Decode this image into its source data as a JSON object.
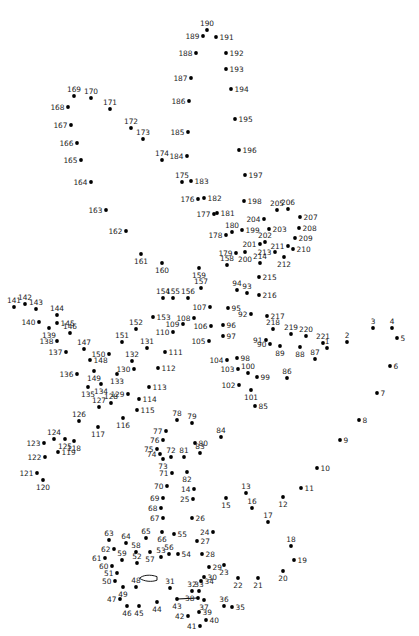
{
  "puzzle": {
    "kind": "connect-the-dots",
    "width": 419,
    "height": 636,
    "dot_radius": 1.9,
    "dot_color": "#000000",
    "label_color": "#1c1c1c",
    "label_font_size": 7.4,
    "point_fields": [
      "number",
      "x",
      "y",
      "label_side"
    ],
    "label_sides": {
      "a": "above",
      "b": "below",
      "l": "left",
      "r": "right"
    },
    "points": [
      [
        1,
        327,
        348,
        "a"
      ],
      [
        2,
        347,
        342,
        "a"
      ],
      [
        3,
        373,
        328,
        "a"
      ],
      [
        4,
        392,
        328,
        "a"
      ],
      [
        5,
        397,
        338,
        "r"
      ],
      [
        6,
        390,
        366,
        "r"
      ],
      [
        7,
        377,
        393,
        "r"
      ],
      [
        8,
        359,
        420,
        "r"
      ],
      [
        9,
        340,
        440,
        "r"
      ],
      [
        10,
        317,
        468,
        "r"
      ],
      [
        11,
        301,
        488,
        "r"
      ],
      [
        12,
        283,
        497,
        "b"
      ],
      [
        13,
        246,
        493,
        "a"
      ],
      [
        14,
        194,
        489,
        "l"
      ],
      [
        15,
        226,
        498,
        "b"
      ],
      [
        16,
        252,
        508,
        "a"
      ],
      [
        17,
        268,
        522,
        "a"
      ],
      [
        18,
        291,
        546,
        "a"
      ],
      [
        19,
        294,
        560,
        "r"
      ],
      [
        20,
        283,
        571,
        "b"
      ],
      [
        21,
        258,
        578,
        "b"
      ],
      [
        22,
        238,
        578,
        "b"
      ],
      [
        23,
        224,
        565,
        "b"
      ],
      [
        24,
        213,
        532,
        "l"
      ],
      [
        25,
        193,
        499,
        "l"
      ],
      [
        26,
        192,
        518,
        "r"
      ],
      [
        27,
        197,
        541,
        "r"
      ],
      [
        28,
        202,
        554,
        "r"
      ],
      [
        29,
        209,
        567,
        "r"
      ],
      [
        30,
        204,
        577,
        "r"
      ],
      [
        31,
        170,
        588,
        "a"
      ],
      [
        32,
        192,
        591,
        "a"
      ],
      [
        33,
        199,
        591,
        "a"
      ],
      [
        34,
        201,
        581,
        "r"
      ],
      [
        35,
        232,
        607,
        "r"
      ],
      [
        36,
        224,
        606,
        "a"
      ],
      [
        37,
        204,
        600,
        "b"
      ],
      [
        38,
        198,
        598,
        "l"
      ],
      [
        39,
        199,
        612,
        "r"
      ],
      [
        40,
        206,
        620,
        "r"
      ],
      [
        41,
        200,
        626,
        "l"
      ],
      [
        42,
        188,
        616,
        "l"
      ],
      [
        43,
        177,
        599,
        "b"
      ],
      [
        44,
        157,
        602,
        "b"
      ],
      [
        45,
        139,
        606,
        "b"
      ],
      [
        46,
        127,
        606,
        "b"
      ],
      [
        47,
        120,
        599,
        "l"
      ],
      [
        48,
        136,
        587,
        "a"
      ],
      [
        49,
        123,
        587,
        "b"
      ],
      [
        50,
        115,
        581,
        "l"
      ],
      [
        51,
        117,
        573,
        "l"
      ],
      [
        52,
        137,
        563,
        "a"
      ],
      [
        53,
        161,
        557,
        "a"
      ],
      [
        54,
        178,
        554,
        "r"
      ],
      [
        55,
        174,
        534,
        "r"
      ],
      [
        56,
        169,
        554,
        "a"
      ],
      [
        57,
        150,
        552,
        "b"
      ],
      [
        58,
        136,
        552,
        "a"
      ],
      [
        59,
        122,
        560,
        "a"
      ],
      [
        60,
        112,
        566,
        "l"
      ],
      [
        61,
        105,
        558,
        "l"
      ],
      [
        62,
        114,
        549,
        "l"
      ],
      [
        63,
        109,
        540,
        "a"
      ],
      [
        64,
        126,
        543,
        "a"
      ],
      [
        65,
        146,
        538,
        "a"
      ],
      [
        66,
        162,
        532,
        "b"
      ],
      [
        67,
        163,
        518,
        "l"
      ],
      [
        68,
        161,
        508,
        "l"
      ],
      [
        69,
        163,
        498,
        "l"
      ],
      [
        70,
        167,
        486,
        "l"
      ],
      [
        71,
        172,
        473,
        "l"
      ],
      [
        72,
        171,
        457,
        "a"
      ],
      [
        73,
        163,
        459,
        "b"
      ],
      [
        74,
        160,
        454,
        "l"
      ],
      [
        75,
        157,
        449,
        "l"
      ],
      [
        76,
        163,
        440,
        "l"
      ],
      [
        77,
        166,
        431,
        "l"
      ],
      [
        78,
        177,
        420,
        "a"
      ],
      [
        79,
        192,
        423,
        "a"
      ],
      [
        80,
        195,
        443,
        "r"
      ],
      [
        81,
        184,
        457,
        "a"
      ],
      [
        82,
        187,
        472,
        "b"
      ],
      [
        83,
        200,
        453,
        "a"
      ],
      [
        84,
        221,
        437,
        "a"
      ],
      [
        85,
        255,
        406,
        "r"
      ],
      [
        86,
        287,
        378,
        "a"
      ],
      [
        87,
        315,
        359,
        "a"
      ],
      [
        88,
        300,
        347,
        "b"
      ],
      [
        89,
        280,
        346,
        "b"
      ],
      [
        90,
        270,
        344,
        "l"
      ],
      [
        91,
        266,
        340,
        "l"
      ],
      [
        92,
        251,
        314,
        "l"
      ],
      [
        93,
        247,
        293,
        "a"
      ],
      [
        94,
        237,
        290,
        "a"
      ],
      [
        95,
        228,
        308,
        "r"
      ],
      [
        96,
        223,
        325,
        "r"
      ],
      [
        97,
        223,
        336,
        "r"
      ],
      [
        98,
        237,
        358,
        "r"
      ],
      [
        99,
        257,
        377,
        "r"
      ],
      [
        100,
        248,
        373,
        "a"
      ],
      [
        101,
        251,
        390,
        "b"
      ],
      [
        102,
        239,
        385,
        "l"
      ],
      [
        103,
        238,
        369,
        "l"
      ],
      [
        104,
        227,
        360,
        "l"
      ],
      [
        105,
        209,
        341,
        "l"
      ],
      [
        106,
        211,
        326,
        "l"
      ],
      [
        107,
        210,
        307,
        "l"
      ],
      [
        108,
        194,
        318,
        "l"
      ],
      [
        109,
        183,
        324,
        "l"
      ],
      [
        110,
        173,
        332,
        "l"
      ],
      [
        111,
        165,
        352,
        "r"
      ],
      [
        112,
        158,
        368,
        "r"
      ],
      [
        113,
        149,
        387,
        "r"
      ],
      [
        114,
        139,
        399,
        "r"
      ],
      [
        115,
        137,
        410,
        "r"
      ],
      [
        116,
        123,
        418,
        "b"
      ],
      [
        117,
        98,
        427,
        "b"
      ],
      [
        118,
        74,
        441,
        "b"
      ],
      [
        119,
        58,
        452,
        "r"
      ],
      [
        120,
        43,
        480,
        "b"
      ],
      [
        121,
        37,
        473,
        "l"
      ],
      [
        122,
        45,
        457,
        "l"
      ],
      [
        123,
        44,
        443,
        "l"
      ],
      [
        124,
        54,
        439,
        "a"
      ],
      [
        125,
        65,
        439,
        "b"
      ],
      [
        126,
        79,
        421,
        "a"
      ],
      [
        127,
        99,
        407,
        "a"
      ],
      [
        128,
        111,
        403,
        "a"
      ],
      [
        129,
        128,
        394,
        "l"
      ],
      [
        130,
        134,
        369,
        "l"
      ],
      [
        131,
        147,
        348,
        "a"
      ],
      [
        132,
        132,
        361,
        "a"
      ],
      [
        133,
        117,
        374,
        "b"
      ],
      [
        134,
        101,
        384,
        "b"
      ],
      [
        135,
        88,
        387,
        "b"
      ],
      [
        136,
        77,
        374,
        "l"
      ],
      [
        137,
        66,
        352,
        "l"
      ],
      [
        138,
        57,
        341,
        "l"
      ],
      [
        139,
        49,
        328,
        "b"
      ],
      [
        140,
        39,
        322,
        "l"
      ],
      [
        141,
        14,
        307,
        "a"
      ],
      [
        142,
        25,
        304,
        "a"
      ],
      [
        143,
        36,
        309,
        "a"
      ],
      [
        144,
        57,
        315,
        "a"
      ],
      [
        145,
        57,
        323,
        "r"
      ],
      [
        146,
        70,
        333,
        "a"
      ],
      [
        147,
        84,
        349,
        "a"
      ],
      [
        148,
        90,
        360,
        "r"
      ],
      [
        149,
        94,
        371,
        "b"
      ],
      [
        150,
        109,
        354,
        "l"
      ],
      [
        151,
        122,
        342,
        "a"
      ],
      [
        152,
        136,
        329,
        "a"
      ],
      [
        153,
        153,
        317,
        "r"
      ],
      [
        154,
        163,
        298,
        "a"
      ],
      [
        155,
        173,
        298,
        "a"
      ],
      [
        156,
        188,
        298,
        "a"
      ],
      [
        157,
        201,
        288,
        "a"
      ],
      [
        158,
        227,
        265,
        "a"
      ],
      [
        159,
        199,
        268,
        "b"
      ],
      [
        160,
        162,
        263,
        "b"
      ],
      [
        161,
        141,
        254,
        "b"
      ],
      [
        162,
        126,
        231,
        "l"
      ],
      [
        163,
        106,
        210,
        "l"
      ],
      [
        164,
        91,
        182,
        "l"
      ],
      [
        165,
        81,
        160,
        "l"
      ],
      [
        166,
        77,
        143,
        "l"
      ],
      [
        167,
        71,
        125,
        "l"
      ],
      [
        168,
        68,
        107,
        "l"
      ],
      [
        169,
        74,
        96,
        "a"
      ],
      [
        170,
        91,
        98,
        "a"
      ],
      [
        171,
        110,
        109,
        "a"
      ],
      [
        172,
        131,
        128,
        "a"
      ],
      [
        173,
        143,
        139,
        "a"
      ],
      [
        174,
        162,
        160,
        "a"
      ],
      [
        175,
        182,
        182,
        "a"
      ],
      [
        176,
        198,
        199,
        "l"
      ],
      [
        177,
        214,
        214,
        "l"
      ],
      [
        178,
        226,
        235,
        "l"
      ],
      [
        179,
        236,
        253,
        "l"
      ],
      [
        180,
        232,
        232,
        "a"
      ],
      [
        181,
        217,
        213,
        "r"
      ],
      [
        182,
        204,
        198,
        "r"
      ],
      [
        183,
        191,
        181,
        "r"
      ],
      [
        184,
        187,
        156,
        "l"
      ],
      [
        185,
        188,
        132,
        "l"
      ],
      [
        186,
        189,
        101,
        "l"
      ],
      [
        187,
        191,
        78,
        "l"
      ],
      [
        188,
        196,
        53,
        "l"
      ],
      [
        189,
        203,
        36,
        "l"
      ],
      [
        190,
        207,
        30,
        "a"
      ],
      [
        191,
        216,
        37,
        "r"
      ],
      [
        192,
        226,
        53,
        "r"
      ],
      [
        193,
        226,
        69,
        "r"
      ],
      [
        194,
        231,
        89,
        "r"
      ],
      [
        195,
        235,
        119,
        "r"
      ],
      [
        196,
        239,
        150,
        "r"
      ],
      [
        197,
        245,
        175,
        "r"
      ],
      [
        198,
        244,
        201,
        "r"
      ],
      [
        199,
        242,
        230,
        "r"
      ],
      [
        200,
        245,
        252,
        "b"
      ],
      [
        201,
        260,
        244,
        "l"
      ],
      [
        202,
        265,
        242,
        "a"
      ],
      [
        203,
        269,
        229,
        "r"
      ],
      [
        204,
        264,
        219,
        "l"
      ],
      [
        205,
        277,
        210,
        "a"
      ],
      [
        206,
        288,
        209,
        "a"
      ],
      [
        207,
        300,
        217,
        "r"
      ],
      [
        208,
        299,
        228,
        "r"
      ],
      [
        209,
        295,
        238,
        "r"
      ],
      [
        210,
        293,
        249,
        "r"
      ],
      [
        211,
        288,
        246,
        "l"
      ],
      [
        212,
        284,
        257,
        "b"
      ],
      [
        213,
        275,
        252,
        "l"
      ],
      [
        214,
        260,
        263,
        "a"
      ],
      [
        215,
        259,
        277,
        "r"
      ],
      [
        216,
        259,
        295,
        "r"
      ],
      [
        217,
        267,
        316,
        "r"
      ],
      [
        218,
        273,
        329,
        "a"
      ],
      [
        219,
        291,
        334,
        "a"
      ],
      [
        220,
        306,
        336,
        "a"
      ],
      [
        221,
        323,
        343,
        "a"
      ]
    ],
    "predrawn_shapes": {
      "beak_outline_path": "M 157 576.6 C 150 574.2 143 575 139.5 578.2 C 144 581.6 152 582.2 157 580.2 Z",
      "segment": {
        "x1": 177.5,
        "y1": 599,
        "x2": 197.5,
        "y2": 598
      }
    }
  }
}
